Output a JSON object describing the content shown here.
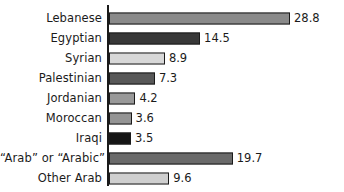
{
  "chart_data": {
    "type": "bar",
    "orientation": "horizontal",
    "title": "",
    "subtitle": "",
    "xlabel": "",
    "ylabel": "",
    "grid": false,
    "legend": null,
    "xlim": [
      0,
      28.8
    ],
    "categories": [
      "Lebanese",
      "Egyptian",
      "Syrian",
      "Palestinian",
      "Jordanian",
      "Moroccan",
      "Iraqi",
      "“Arab” or “Arabic”",
      "Other Arab"
    ],
    "values": [
      28.8,
      14.5,
      8.9,
      7.3,
      4.2,
      3.6,
      3.5,
      19.7,
      9.6
    ],
    "value_labels": [
      "28.8",
      "14.5",
      "8.9",
      "7.3",
      "4.2",
      "3.6",
      "3.5",
      "19.7",
      "9.6"
    ],
    "bar_colors": [
      "#8a8a8a",
      "#383838",
      "#d8d8d8",
      "#585858",
      "#999999",
      "#949494",
      "#151515",
      "#6a6a6a",
      "#cfcfcf"
    ],
    "bar_border_color": "#1a1a1a",
    "axis_color": "#1a1a1a",
    "text_color": "#1b1b1b",
    "background": "#ffffff"
  }
}
